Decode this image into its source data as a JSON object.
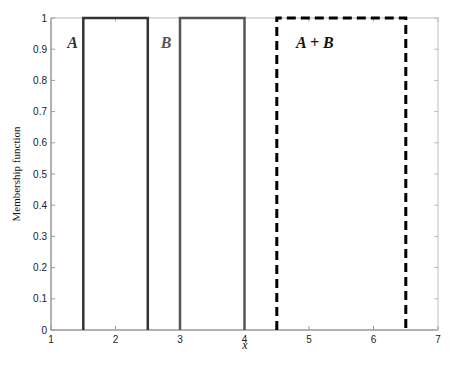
{
  "chart_data": {
    "type": "line",
    "title": "",
    "xlabel": "x",
    "ylabel": "Membership function",
    "xlim": [
      1,
      7
    ],
    "ylim": [
      0,
      1
    ],
    "xticks": [
      1,
      2,
      3,
      4,
      5,
      6,
      7
    ],
    "yticks": [
      0,
      0.1,
      0.2,
      0.3,
      0.4,
      0.5,
      0.6,
      0.7,
      0.8,
      0.9,
      1
    ],
    "grid": false,
    "legend": null,
    "series": [
      {
        "name": "A",
        "style": "solid",
        "color": "#333333",
        "x": [
          1.5,
          1.5,
          2.5,
          2.5
        ],
        "y": [
          0,
          1,
          1,
          0
        ]
      },
      {
        "name": "B",
        "style": "solid",
        "color": "#555555",
        "x": [
          3,
          3,
          4,
          4
        ],
        "y": [
          0,
          1,
          1,
          0
        ]
      },
      {
        "name": "A + B",
        "style": "dashed",
        "color": "#000000",
        "x": [
          4.5,
          4.5,
          6.5,
          6.5
        ],
        "y": [
          0,
          1,
          1,
          0
        ]
      }
    ],
    "annotations": [
      {
        "text": "A",
        "x": 1.25,
        "y": 0.92
      },
      {
        "text": "B",
        "x": 2.7,
        "y": 0.92
      },
      {
        "text": "A + B",
        "x": 4.8,
        "y": 0.92
      }
    ]
  }
}
